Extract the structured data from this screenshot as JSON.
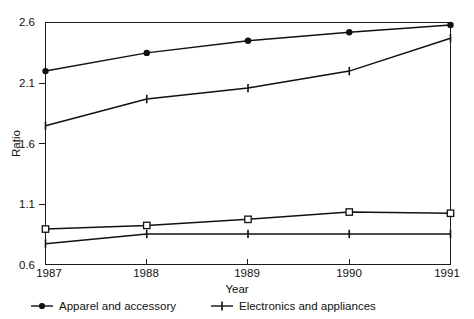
{
  "chart_data": {
    "type": "line",
    "title": "",
    "xlabel": "Year",
    "ylabel": "Ratio",
    "categories": [
      "1987",
      "1988",
      "1989",
      "1990",
      "1991"
    ],
    "x": [
      1987,
      1988,
      1989,
      1990,
      1991
    ],
    "xlim": [
      1987,
      1991
    ],
    "ylim": [
      0.6,
      2.6
    ],
    "yticks": [
      0.6,
      1.1,
      1.6,
      2.1,
      2.6
    ],
    "ytick_labels": [
      "0.6",
      "1.1",
      "1.6",
      "2.1",
      "2.6"
    ],
    "grid": false,
    "legend_position": "bottom-left",
    "series": [
      {
        "name": "Apparel and accessory",
        "marker": "filled-circle",
        "color": "#111111",
        "values": [
          2.2,
          2.35,
          2.45,
          2.52,
          2.58
        ]
      },
      {
        "name": "Electronics and appliances",
        "marker": "plus",
        "color": "#111111",
        "values": [
          1.75,
          1.97,
          2.06,
          2.2,
          2.47
        ]
      },
      {
        "name": "",
        "marker": "open-square",
        "color": "#111111",
        "values": [
          0.9,
          0.93,
          0.98,
          1.04,
          1.03
        ]
      },
      {
        "name": "",
        "marker": "plus",
        "color": "#111111",
        "values": [
          0.78,
          0.86,
          0.86,
          0.86,
          0.86
        ]
      }
    ]
  },
  "legend": {
    "items": [
      {
        "label": "Apparel and accessory",
        "marker": "filled-circle"
      },
      {
        "label": "Electronics and appliances",
        "marker": "plus"
      }
    ]
  },
  "axes": {
    "y_title": "Ratio",
    "x_title": "Year",
    "y_labels": [
      "2.6",
      "2.1",
      "1.6",
      "1.1",
      "0.6"
    ],
    "x_labels": [
      "1987",
      "1988",
      "1989",
      "1990",
      "1991"
    ]
  }
}
